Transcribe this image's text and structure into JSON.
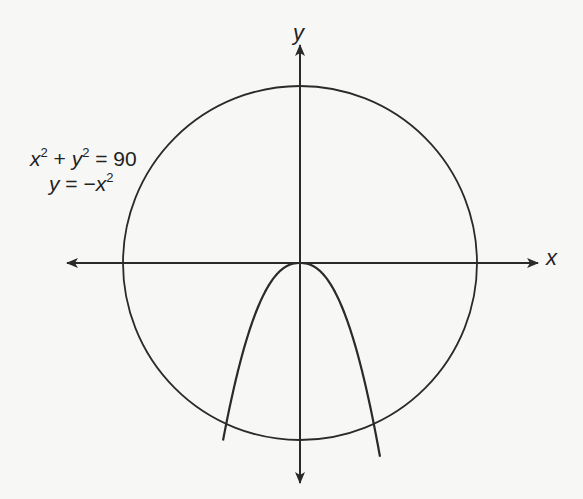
{
  "figure": {
    "type": "coordinate-plane-graph",
    "axes": {
      "x_label": "x",
      "y_label": "y",
      "origin_px": [
        300,
        263
      ]
    },
    "equations": {
      "circle": {
        "lhs_x": "x",
        "lhs_x_exp": "2",
        "plus": " + ",
        "lhs_y": "y",
        "lhs_y_exp": "2",
        "rhs": " = 90"
      },
      "parabola": {
        "lhs": "y",
        "eq": " = −",
        "rhs_x": "x",
        "rhs_exp": "2"
      }
    },
    "curves": [
      {
        "name": "circle",
        "equation": "x² + y² = 90",
        "center_px": [
          300,
          263
        ],
        "radius_px": 177
      },
      {
        "name": "parabola",
        "equation": "y = −x²",
        "vertex_px": [
          300,
          263
        ],
        "opens": "down"
      }
    ],
    "colors": {
      "line": "#2a2a2a",
      "background": "#f7f7f5"
    }
  }
}
